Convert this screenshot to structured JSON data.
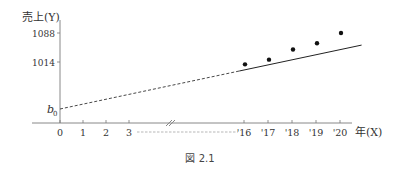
{
  "chart_data": {
    "type": "scatter",
    "title": "",
    "caption": "図 2.1",
    "ylabel": "売上(Y)",
    "xlabel": "年(X)",
    "intercept_label": "b0",
    "y_ticks": [
      {
        "value": 1088,
        "label": "1088"
      },
      {
        "value": 1014,
        "label": "1014"
      }
    ],
    "x_ticks_left": [
      {
        "value": 0,
        "label": "0"
      },
      {
        "value": 1,
        "label": "1"
      },
      {
        "value": 2,
        "label": "2"
      },
      {
        "value": 3,
        "label": "3"
      }
    ],
    "x_ticks_right": [
      {
        "value": 16,
        "label": "'16"
      },
      {
        "value": 17,
        "label": "'17"
      },
      {
        "value": 18,
        "label": "'18"
      },
      {
        "value": 19,
        "label": "'19"
      },
      {
        "value": 20,
        "label": "'20"
      }
    ],
    "axis_break": true,
    "points": [
      {
        "x": 16,
        "y": 1008
      },
      {
        "x": 17,
        "y": 1020
      },
      {
        "x": 18,
        "y": 1046
      },
      {
        "x": 19,
        "y": 1062
      },
      {
        "x": 20,
        "y": 1088
      }
    ],
    "fit_line": {
      "style": "solid",
      "x_range": [
        15.8,
        20.9
      ]
    },
    "extrapolation": {
      "style": "dashed",
      "from_label": "b0",
      "to_x": 15.8
    }
  }
}
